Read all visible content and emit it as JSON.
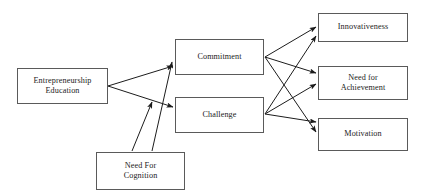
{
  "diagram": {
    "type": "flow-diagram",
    "canvas": {
      "width": 425,
      "height": 196
    },
    "style": {
      "box_border_color": "#5a5a5a",
      "box_fill_color": "#ffffff",
      "arrow_color": "#1c1c1c",
      "background_color": "#ffffff",
      "text_color": "#1c1c1c"
    },
    "nodes": [
      {
        "id": "entrepreneurship-education",
        "label": "Entrepreneurship\nEducation",
        "x": 17,
        "y": 68,
        "w": 91,
        "h": 36,
        "role": "antecedent"
      },
      {
        "id": "need-for-cognition",
        "label": "Need For\nCognition",
        "x": 96,
        "y": 152,
        "w": 89,
        "h": 38,
        "role": "antecedent"
      },
      {
        "id": "commitment",
        "label": "Commitment",
        "x": 175,
        "y": 39,
        "w": 89,
        "h": 36,
        "role": "mediator"
      },
      {
        "id": "challenge",
        "label": "Challenge",
        "x": 175,
        "y": 97,
        "w": 89,
        "h": 36,
        "role": "mediator"
      },
      {
        "id": "innovativeness",
        "label": "Innovativeness",
        "x": 318,
        "y": 13,
        "w": 90,
        "h": 29,
        "role": "outcome"
      },
      {
        "id": "need-for-achievement",
        "label": "Need for\nAchievement",
        "x": 318,
        "y": 66,
        "w": 90,
        "h": 34,
        "role": "outcome"
      },
      {
        "id": "motivation",
        "label": "Motivation",
        "x": 318,
        "y": 118,
        "w": 90,
        "h": 33,
        "role": "outcome"
      }
    ],
    "edges": [
      {
        "id": "ee-to-commitment",
        "from": "entrepreneurship-education",
        "to": "commitment",
        "x1": 108,
        "y1": 86,
        "x2": 173,
        "y2": 66,
        "arrow": true
      },
      {
        "id": "ee-to-challenge",
        "from": "entrepreneurship-education",
        "to": "challenge",
        "x1": 108,
        "y1": 86,
        "x2": 173,
        "y2": 107,
        "arrow": true
      },
      {
        "id": "nfc-to-commitment",
        "from": "need-for-cognition",
        "to": "commitment",
        "x1": 152,
        "y1": 151,
        "x2": 172,
        "y2": 62,
        "arrow": true
      },
      {
        "id": "nfc-to-challenge",
        "from": "need-for-cognition",
        "to": "challenge",
        "x1": 132,
        "y1": 151,
        "x2": 152,
        "y2": 102,
        "arrow": true
      },
      {
        "id": "commitment-to-innovativeness",
        "from": "commitment",
        "to": "innovativeness",
        "x1": 265,
        "y1": 57,
        "x2": 316,
        "y2": 27,
        "arrow": true
      },
      {
        "id": "commitment-to-need-for-achievement",
        "from": "commitment",
        "to": "need-for-achievement",
        "x1": 265,
        "y1": 57,
        "x2": 316,
        "y2": 73,
        "arrow": true
      },
      {
        "id": "commitment-to-motivation",
        "from": "commitment",
        "to": "motivation",
        "x1": 265,
        "y1": 57,
        "x2": 316,
        "y2": 132,
        "arrow": true
      },
      {
        "id": "challenge-to-innovativeness",
        "from": "challenge",
        "to": "innovativeness",
        "x1": 265,
        "y1": 114,
        "x2": 316,
        "y2": 36,
        "arrow": true
      },
      {
        "id": "challenge-to-need-for-achievement",
        "from": "challenge",
        "to": "need-for-achievement",
        "x1": 265,
        "y1": 114,
        "x2": 316,
        "y2": 84,
        "arrow": true
      },
      {
        "id": "challenge-to-motivation",
        "from": "challenge",
        "to": "motivation",
        "x1": 265,
        "y1": 114,
        "x2": 316,
        "y2": 122,
        "arrow": true
      }
    ]
  }
}
